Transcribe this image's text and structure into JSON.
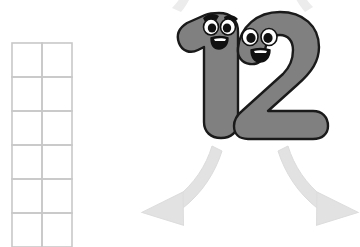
{
  "canvas": {
    "width": 360,
    "height": 247,
    "background": "#ffffff"
  },
  "colors": {
    "grid_line": "#c8c8c8",
    "number_fill": "#808080",
    "number_outline": "#1a1a1a",
    "eye_white": "#ffffff",
    "pupil": "#111111",
    "eyebrow": "#111111",
    "mouth_outline": "#111111",
    "mouth_inner": "#ffffff",
    "arrow_fill": "#e2e2e2",
    "arrow_outline": "#d6d6d6"
  },
  "ten_frame": {
    "label": "ten-frame-grid",
    "columns": 2,
    "rows_visible": 6,
    "x": 12,
    "y": 43,
    "cell_width": 30,
    "cell_height": 34,
    "line_width": 1.6,
    "filled_cells": 0,
    "cells": [
      {
        "row": 1,
        "col": 1,
        "filled": false
      },
      {
        "row": 1,
        "col": 2,
        "filled": false
      },
      {
        "row": 2,
        "col": 1,
        "filled": false
      },
      {
        "row": 2,
        "col": 2,
        "filled": false
      },
      {
        "row": 3,
        "col": 1,
        "filled": false
      },
      {
        "row": 3,
        "col": 2,
        "filled": false
      },
      {
        "row": 4,
        "col": 1,
        "filled": false
      },
      {
        "row": 4,
        "col": 2,
        "filled": false
      },
      {
        "row": 5,
        "col": 1,
        "filled": false
      },
      {
        "row": 5,
        "col": 2,
        "filled": false
      },
      {
        "row": 6,
        "col": 1,
        "filled": false
      },
      {
        "row": 6,
        "col": 2,
        "filled": false
      }
    ]
  },
  "number": {
    "value": "12",
    "digits": [
      {
        "glyph": "1",
        "name": "digit-one",
        "has_eyebrows": true,
        "eyes": 2,
        "expression": "smiling"
      },
      {
        "glyph": "2",
        "name": "digit-two",
        "has_eyebrows": false,
        "eyes": 2,
        "expression": "smiling"
      }
    ]
  },
  "arrows": [
    {
      "name": "arrow-down-left",
      "direction": "down-left",
      "style": "curved"
    },
    {
      "name": "arrow-down-right",
      "direction": "down-right",
      "style": "curved"
    },
    {
      "name": "arrow-tail-top-left",
      "direction": "incoming",
      "style": "curved-partial"
    },
    {
      "name": "arrow-tail-top-right",
      "direction": "incoming",
      "style": "curved-partial"
    }
  ]
}
